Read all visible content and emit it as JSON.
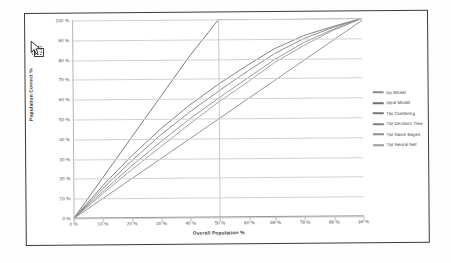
{
  "chart_data": {
    "type": "line",
    "title": "",
    "xlabel": "Overall Population %",
    "ylabel": "Population Correct %",
    "xlim": [
      0,
      99
    ],
    "ylim": [
      0,
      100
    ],
    "grid": true,
    "legend_position": "right",
    "x_ticks": [
      "0 %",
      "10 %",
      "20 %",
      "30 %",
      "40 %",
      "50 %",
      "60 %",
      "69 %",
      "79 %",
      "89 %",
      "99 %"
    ],
    "x_tick_values": [
      0,
      10,
      20,
      30,
      40,
      50,
      60,
      69,
      79,
      89,
      99
    ],
    "y_ticks": [
      "0 %",
      "10 %",
      "20 %",
      "30 %",
      "40 %",
      "50 %",
      "60 %",
      "70 %",
      "80 %",
      "90 %",
      "100 %"
    ],
    "y_tick_values": [
      0,
      10,
      20,
      30,
      40,
      50,
      60,
      70,
      80,
      90,
      100
    ],
    "x": [
      0,
      10,
      20,
      30,
      40,
      50,
      60,
      69,
      79,
      89,
      99
    ],
    "series": [
      {
        "name": "No Model",
        "color": "#8a8a8a",
        "values": [
          0,
          10,
          20,
          30,
          40,
          50,
          60,
          69,
          79,
          89,
          99
        ]
      },
      {
        "name": "Ideal Model",
        "color": "#6e6e6e",
        "values": [
          0,
          20.4,
          40.8,
          61.2,
          81.6,
          100,
          100,
          100,
          100,
          100,
          100
        ]
      },
      {
        "name": "TM Clustering",
        "color": "#767676",
        "values": [
          0,
          16.5,
          31.5,
          45.0,
          57.0,
          67.5,
          77.0,
          85.0,
          91.5,
          96.0,
          100
        ]
      },
      {
        "name": "TM Decision Tree",
        "color": "#828282",
        "values": [
          0,
          15.0,
          29.0,
          42.0,
          53.5,
          64.0,
          74.0,
          82.5,
          90.0,
          95.5,
          100
        ]
      },
      {
        "name": "TM Naive Bayes",
        "color": "#8e8e8e",
        "values": [
          0,
          13.5,
          26.5,
          38.5,
          50.0,
          60.5,
          70.5,
          79.5,
          88.0,
          94.5,
          100
        ]
      },
      {
        "name": "TM Neural Net",
        "color": "#9a9a9a",
        "values": [
          0,
          12.5,
          24.5,
          36.0,
          47.5,
          58.5,
          68.5,
          78.0,
          86.5,
          94.0,
          100
        ]
      }
    ]
  },
  "cursor": {
    "icon": "pointer-with-marquee-cursor"
  }
}
